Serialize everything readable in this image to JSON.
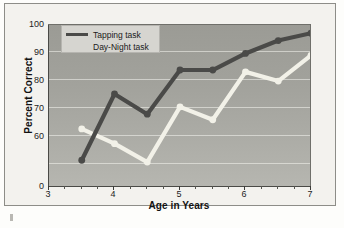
{
  "chart_data": {
    "type": "line",
    "title": "",
    "xlabel": "Age in Years",
    "ylabel": "Percent Correct",
    "x": [
      3.5,
      4.0,
      4.5,
      5.0,
      5.5,
      6.0,
      6.5,
      7.0
    ],
    "series": [
      {
        "name": "Tapping task",
        "color": "#4a4a48",
        "values": [
          64,
          82,
          76.5,
          88.5,
          88.5,
          93,
          96.5,
          98.5
        ]
      },
      {
        "name": "Day-Night task",
        "color": "#f2f1e8",
        "values": [
          72.5,
          68.5,
          63.5,
          78.5,
          75,
          88,
          85.5,
          92.5
        ]
      }
    ],
    "xlim": [
      3,
      7
    ],
    "ylim": [
      57,
      101
    ],
    "y_axis_broken": true,
    "yticks": [
      0,
      60,
      70,
      80,
      90,
      100
    ],
    "ytick_labels": [
      "0",
      "60",
      "70",
      "80",
      "90",
      "100"
    ],
    "xticks": [
      3,
      4,
      5,
      6,
      7
    ],
    "xtick_labels": [
      "3",
      "4",
      "5",
      "6",
      "7"
    ],
    "xticks_minor": [
      3.25,
      3.5,
      3.75,
      4.25,
      4.5,
      4.75,
      5.25,
      5.5,
      5.75,
      6.25,
      6.5,
      6.75
    ],
    "grid": true,
    "grid_axis": "y",
    "legend_position": "upper-left",
    "markers": "circle",
    "plot_background": "#a3a39d",
    "figure_background": "#f3f2ee"
  },
  "legend": {
    "items": [
      {
        "label": "Tapping task",
        "color": "#4a4a48",
        "show_swatch": true
      },
      {
        "label": "Day-Night task",
        "color": "#f2f1e8",
        "show_swatch": false
      }
    ]
  },
  "axes": {
    "y_title": "Percent Correct",
    "x_title": "Age in Years",
    "y_tick_labels": [
      "100",
      "90",
      "80",
      "70",
      "60",
      "0"
    ],
    "x_tick_labels": [
      "3",
      "4",
      "5",
      "6",
      "7"
    ]
  }
}
